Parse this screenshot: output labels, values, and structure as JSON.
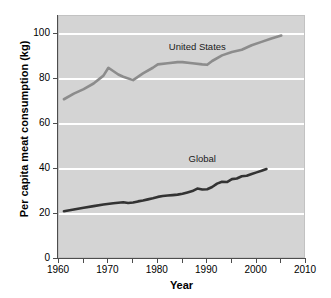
{
  "chart_data": {
    "type": "line",
    "title": "",
    "xlabel": "Year",
    "ylabel": "Per capita meat consumption (kg)",
    "xlim": [
      1960,
      2010
    ],
    "ylim": [
      0,
      108
    ],
    "grid": "horizontal-white-gridlines",
    "legend_position": "inline-labels",
    "x_ticks": [
      1960,
      1970,
      1980,
      1990,
      2000,
      2010
    ],
    "x_minor_ticks": [
      1965,
      1975,
      1985,
      1995,
      2005
    ],
    "y_ticks": [
      0,
      20,
      40,
      60,
      80,
      100
    ],
    "background_color": "#d4d4d4",
    "gridline_color": "#ffffff",
    "series": [
      {
        "name": "United States",
        "color": "#8c8c8c",
        "label_x": 1988,
        "label_y": 94,
        "x": [
          1961,
          1963,
          1965,
          1967,
          1969,
          1970,
          1972,
          1973,
          1975,
          1977,
          1979,
          1980,
          1982,
          1984,
          1985,
          1987,
          1989,
          1990,
          1991,
          1993,
          1995,
          1997,
          1999,
          2001,
          2003,
          2005
        ],
        "y": [
          71.0,
          73.5,
          75.5,
          78.0,
          81.5,
          85.0,
          82.0,
          81.0,
          79.5,
          82.5,
          85.0,
          86.5,
          87.0,
          87.5,
          87.5,
          87.0,
          86.5,
          86.3,
          88.0,
          90.5,
          92.0,
          93.0,
          95.0,
          96.5,
          98.0,
          99.3
        ]
      },
      {
        "name": "Global",
        "color": "#333333",
        "label_x": 1989,
        "label_y": 44,
        "x": [
          1961,
          1963,
          1965,
          1967,
          1969,
          1971,
          1972,
          1973,
          1974,
          1975,
          1976,
          1977,
          1978,
          1979,
          1980,
          1981,
          1982,
          1983,
          1984,
          1985,
          1986,
          1987,
          1988,
          1989,
          1990,
          1991,
          1992,
          1993,
          1994,
          1995,
          1996,
          1997,
          1998,
          1999,
          2000,
          2001,
          2002
        ],
        "y": [
          21.2,
          22.0,
          22.8,
          23.5,
          24.2,
          24.8,
          25.0,
          25.2,
          24.9,
          25.1,
          25.6,
          26.0,
          26.5,
          27.0,
          27.6,
          28.0,
          28.2,
          28.4,
          28.6,
          29.0,
          29.6,
          30.2,
          31.3,
          30.9,
          31.0,
          32.0,
          33.5,
          34.3,
          34.2,
          35.5,
          35.8,
          36.8,
          37.0,
          37.8,
          38.5,
          39.2,
          40.0
        ]
      }
    ]
  }
}
